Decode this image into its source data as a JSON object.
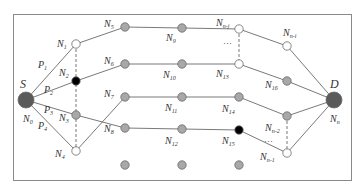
{
  "diagram": {
    "type": "network-multipath",
    "colors": {
      "frame": "#8a8a8a",
      "edge": "#6a6a6a",
      "endpoint": "#5a5a5a",
      "relay": "#a8a8a8",
      "idle": "#ffffff",
      "failed": "#000000"
    },
    "source": {
      "label": "S",
      "node": "N",
      "sub": "0"
    },
    "destination": {
      "label": "D",
      "node": "N",
      "sub": "n"
    },
    "paths": [
      {
        "label": "P",
        "sub": "1"
      },
      {
        "label": "P",
        "sub": "2"
      },
      {
        "label": "P",
        "sub": "3"
      },
      {
        "label": "P",
        "sub": "4"
      }
    ],
    "nodes": [
      {
        "id": "N1",
        "base": "N",
        "sub": "1",
        "state": "idle"
      },
      {
        "id": "N2",
        "base": "N",
        "sub": "2",
        "state": "failed"
      },
      {
        "id": "N3",
        "base": "N",
        "sub": "3",
        "state": "relay"
      },
      {
        "id": "N4",
        "base": "N",
        "sub": "4",
        "state": "idle"
      },
      {
        "id": "N5",
        "base": "N",
        "sub": "5",
        "state": "relay"
      },
      {
        "id": "N6",
        "base": "N",
        "sub": "6",
        "state": "relay"
      },
      {
        "id": "N7",
        "base": "N",
        "sub": "7",
        "state": "relay"
      },
      {
        "id": "N8",
        "base": "N",
        "sub": "8",
        "state": "relay"
      },
      {
        "id": "N9",
        "base": "N",
        "sub": "9",
        "state": "relay"
      },
      {
        "id": "N10",
        "base": "N",
        "sub": "10",
        "state": "relay"
      },
      {
        "id": "N11",
        "base": "N",
        "sub": "11",
        "state": "relay"
      },
      {
        "id": "N12",
        "base": "N",
        "sub": "12",
        "state": "relay"
      },
      {
        "id": "N13",
        "base": "N",
        "sub": "13",
        "state": "idle"
      },
      {
        "id": "N14",
        "base": "N",
        "sub": "14",
        "state": "relay"
      },
      {
        "id": "N15",
        "base": "N",
        "sub": "15",
        "state": "failed"
      },
      {
        "id": "N16",
        "base": "N",
        "sub": "16",
        "state": "relay"
      },
      {
        "id": "Nn-j",
        "base": "N",
        "sub": "n-j",
        "state": "idle"
      },
      {
        "id": "Nn-i",
        "base": "N",
        "sub": "n-i",
        "state": "idle"
      },
      {
        "id": "Nn-2",
        "base": "N",
        "sub": "n-2",
        "state": "relay"
      },
      {
        "id": "Nn-1",
        "base": "N",
        "sub": "n-1",
        "state": "idle"
      }
    ],
    "ellipsis": "…"
  }
}
